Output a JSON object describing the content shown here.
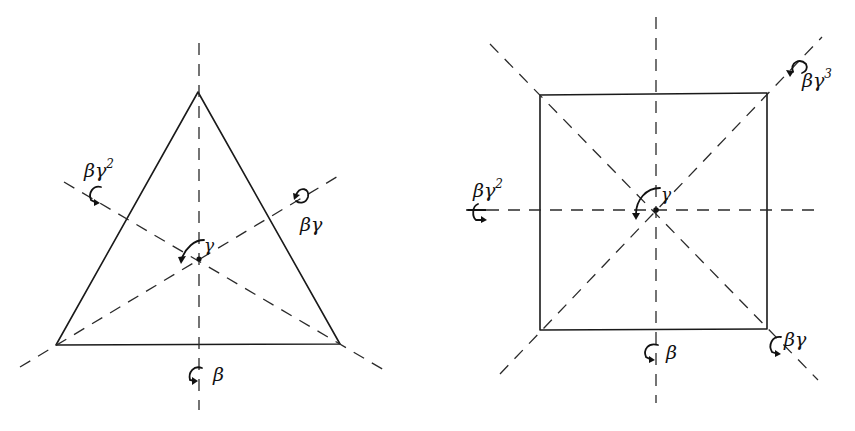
{
  "figures": [
    {
      "name": "triangle",
      "shape": "equilateral-triangle",
      "center_label": "γ",
      "axes": [
        {
          "id": "vertical",
          "label": "β"
        },
        {
          "id": "right-diagonal",
          "label": "βγ"
        },
        {
          "id": "left-diagonal",
          "label": "βγ",
          "exponent": "2"
        }
      ]
    },
    {
      "name": "square",
      "shape": "square",
      "center_label": "γ",
      "axes": [
        {
          "id": "vertical",
          "label": "β"
        },
        {
          "id": "main-diagonal-se",
          "label": "βγ"
        },
        {
          "id": "horizontal",
          "label": "βγ",
          "exponent": "2"
        },
        {
          "id": "anti-diagonal-ne",
          "label": "βγ",
          "exponent": "3"
        }
      ]
    }
  ],
  "colors": {
    "ink": "#111111",
    "background": "#ffffff"
  }
}
